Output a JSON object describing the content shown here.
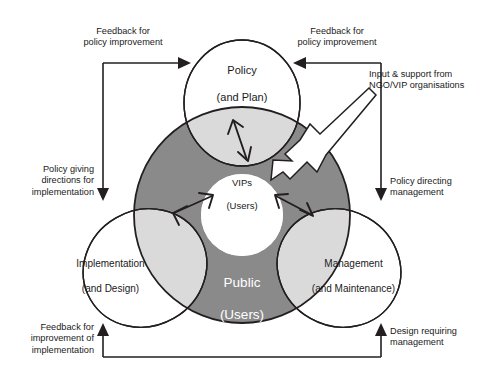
{
  "diagram": {
    "title_hidden": "",
    "colors": {
      "dark_gray": "#8a8a8a",
      "light_gray": "#dcdcdc",
      "lens_gray": "#d9d9d9",
      "white": "#ffffff",
      "stroke": "#231f20",
      "text": "#1a1a1a"
    },
    "nodes": {
      "policy": {
        "line1": "Policy",
        "line2": "(and Plan)"
      },
      "implementation": {
        "line1": "Implementation",
        "line2": "(and Design)"
      },
      "management": {
        "line1": "Management",
        "line2": "(and Maintenance)"
      },
      "public": {
        "line1": "Public",
        "line2": "(Users)"
      },
      "vips": {
        "line1": "VIPs",
        "line2": "(Users)"
      }
    },
    "annotations": {
      "feedback_left": "Feedback for\npolicy improvement",
      "feedback_right": "Feedback for\npolicy improvement",
      "ngo_input": "Input & support from\nNGO/VIP organisations",
      "policy_directions": "Policy giving\ndirections for\nimplementation",
      "policy_directing": "Policy directing\nmanagement",
      "feedback_implementation": "Feedback for\nimprovement of\nimplementation",
      "design_requiring": "Design requiring\nmanagement"
    }
  }
}
